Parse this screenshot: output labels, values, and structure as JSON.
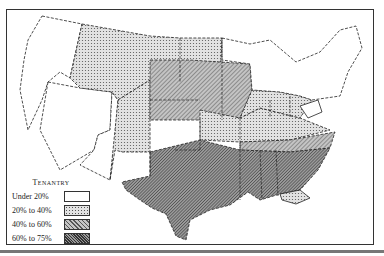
{
  "map": {
    "subject": "Farm tenancy in the United States",
    "legend": {
      "title": "Tenantry",
      "items": [
        {
          "label": "Under 20%",
          "fill": "#ffffff",
          "pattern": "none"
        },
        {
          "label": "20% to 40%",
          "fill": "#d8d8d8",
          "pattern": "dots"
        },
        {
          "label": "40% to 60%",
          "fill": "#b0b0b0",
          "pattern": "light-hatch"
        },
        {
          "label": "60% to 75%",
          "fill": "#7a7a7a",
          "pattern": "dense-hatch"
        }
      ]
    },
    "colors": {
      "under20": "#ffffff",
      "20to40": "#d6d6d6",
      "40to60": "#aaaaaa",
      "60to75": "#7c7c7c",
      "border": "#222222"
    }
  }
}
